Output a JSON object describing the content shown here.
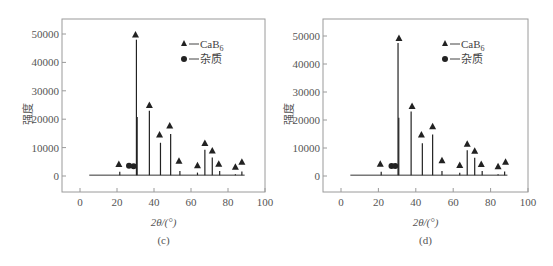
{
  "chart_data": [
    {
      "type": "line",
      "panel": "c",
      "caption": "(c)",
      "title": "",
      "xlabel": "2θ/(°)",
      "ylabel": "强度",
      "xlim": [
        -10,
        100
      ],
      "ylim": [
        -5000,
        57000
      ],
      "xticks": [
        0,
        20,
        40,
        60,
        80,
        100
      ],
      "yticks": [
        0,
        10000,
        20000,
        30000,
        40000,
        50000
      ],
      "grid": false,
      "legend": {
        "position": "top-right",
        "entries": [
          {
            "marker": "triangle",
            "label": "CaB",
            "subscript": "6"
          },
          {
            "marker": "circle",
            "label": "杂质"
          }
        ]
      },
      "baseline": {
        "x_start": 5,
        "x_end": 89,
        "value": 300
      },
      "peaks": [
        {
          "x": 21.5,
          "y": 1500
        },
        {
          "x": 30.5,
          "y": 48000
        },
        {
          "x": 30.9,
          "y": 20800
        },
        {
          "x": 37.5,
          "y": 23000
        },
        {
          "x": 43.5,
          "y": 11700
        },
        {
          "x": 49.0,
          "y": 14800
        },
        {
          "x": 54.0,
          "y": 1800
        },
        {
          "x": 63.5,
          "y": 1200
        },
        {
          "x": 67.5,
          "y": 9200
        },
        {
          "x": 71.5,
          "y": 6500
        },
        {
          "x": 75.5,
          "y": 1800
        },
        {
          "x": 84.0,
          "y": 600
        },
        {
          "x": 87.5,
          "y": 1600
        }
      ],
      "triangle_markers": [
        {
          "x": 21,
          "y": 4200
        },
        {
          "x": 30,
          "y": 49800
        },
        {
          "x": 37.5,
          "y": 25000
        },
        {
          "x": 43,
          "y": 14600
        },
        {
          "x": 48.5,
          "y": 17800
        },
        {
          "x": 53.5,
          "y": 5400
        },
        {
          "x": 63.5,
          "y": 3800
        },
        {
          "x": 67.5,
          "y": 11600
        },
        {
          "x": 71.5,
          "y": 9000
        },
        {
          "x": 75,
          "y": 4300
        },
        {
          "x": 84,
          "y": 3300
        },
        {
          "x": 87.5,
          "y": 5000
        }
      ],
      "circle_markers": [
        {
          "x": 26.5,
          "y": 3600
        },
        {
          "x": 29,
          "y": 3400
        }
      ]
    },
    {
      "type": "line",
      "panel": "d",
      "caption": "(d)",
      "title": "",
      "xlabel": "2θ/(°)",
      "ylabel": "强度",
      "xlim": [
        -10,
        100
      ],
      "ylim": [
        -5000,
        57000
      ],
      "xticks": [
        0,
        20,
        40,
        60,
        80,
        100
      ],
      "yticks": [
        0,
        10000,
        20000,
        30000,
        40000,
        50000
      ],
      "grid": false,
      "legend": {
        "position": "top-right",
        "entries": [
          {
            "marker": "triangle",
            "label": "CaB",
            "subscript": "6"
          },
          {
            "marker": "circle",
            "label": "杂质"
          }
        ]
      },
      "baseline": {
        "x_start": 5,
        "x_end": 89,
        "value": 300
      },
      "peaks": [
        {
          "x": 21.5,
          "y": 1500
        },
        {
          "x": 30.5,
          "y": 47500
        },
        {
          "x": 30.9,
          "y": 20800
        },
        {
          "x": 37.5,
          "y": 23000
        },
        {
          "x": 43.5,
          "y": 11700
        },
        {
          "x": 49.0,
          "y": 14800
        },
        {
          "x": 54.0,
          "y": 1800
        },
        {
          "x": 63.5,
          "y": 1200
        },
        {
          "x": 67.5,
          "y": 9200
        },
        {
          "x": 71.5,
          "y": 6500
        },
        {
          "x": 75.5,
          "y": 1800
        },
        {
          "x": 84.0,
          "y": 600
        },
        {
          "x": 87.5,
          "y": 1600
        }
      ],
      "triangle_markers": [
        {
          "x": 21,
          "y": 4400
        },
        {
          "x": 31,
          "y": 49300
        },
        {
          "x": 38,
          "y": 25000
        },
        {
          "x": 43,
          "y": 14800
        },
        {
          "x": 49,
          "y": 17800
        },
        {
          "x": 54,
          "y": 5600
        },
        {
          "x": 63.5,
          "y": 3900
        },
        {
          "x": 67.5,
          "y": 11500
        },
        {
          "x": 71.5,
          "y": 9000
        },
        {
          "x": 75,
          "y": 4300
        },
        {
          "x": 84,
          "y": 3500
        },
        {
          "x": 88,
          "y": 5100
        }
      ],
      "circle_markers": [
        {
          "x": 27,
          "y": 3600
        },
        {
          "x": 29,
          "y": 3600
        }
      ]
    }
  ]
}
